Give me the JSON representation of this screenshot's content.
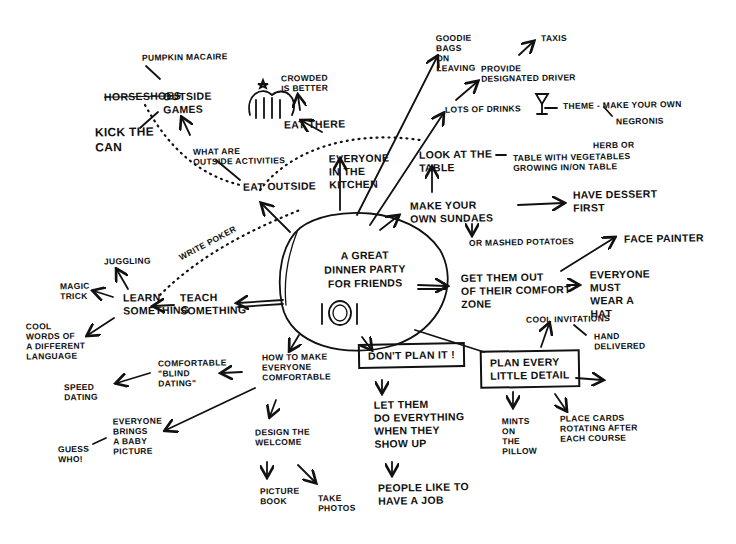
{
  "center": {
    "title": "A GREAT\nDINNER PARTY\nFOR FRIENDS",
    "icon": "plate-and-cutlery-icon"
  },
  "nodes": {
    "pumpkin": "PUMPKIN MACAIRE",
    "horseshoes": "HORSESHOES",
    "outside_games": "OUTSIDE\nGAMES",
    "kick_can": "KICK THE\nCAN",
    "outside_activities": "WHAT ARE\nOUTSIDE ACTIVITIES",
    "eat_outside": "EAT OUTSIDE",
    "crowded": "CROWDED\nIS BETTER",
    "eat_there": "EAT THERE",
    "kitchen": "EVERYONE\nIN THE\nKITCHEN",
    "goodie": "GOODIE\nBAGS\nON\nLEAVING",
    "taxis": "TAXIS",
    "driver": "PROVIDE\nDESIGNATED DRIVER",
    "drinks": "LOTS OF DRINKS",
    "theme": "THEME - MAKE YOUR OWN",
    "negronis": "NEGRONIS",
    "look_table": "LOOK AT THE\nTABLE",
    "herb": "HERB OR",
    "table_veg": "TABLE WITH VEGETABLES\nGROWING IN/ON TABLE",
    "sundaes": "MAKE YOUR\nOWN SUNDAES",
    "dessert": "HAVE DESSERT\nFIRST",
    "potatoes": "OR MASHED POTATOES",
    "face_painter": "FACE PAINTER",
    "comfort_zone": "GET THEM OUT\nOF THEIR COMFORT\nZONE",
    "hat": "EVERYONE\nMUST\nWEAR A\nHAT",
    "invitations": "COOL INVITATIONS",
    "hand_delivered": "HAND\nDELIVERED",
    "plan_every": "PLAN EVERY\nLITTLE DETAIL",
    "dont_plan": "DON'T PLAN IT !",
    "mints": "MINTS\nON\nTHE\nPILLOW",
    "place_cards": "PLACE CARDS\nROTATING AFTER\nEACH COURSE",
    "let_them": "LET THEM\nDO EVERYTHING\nWHEN THEY\nSHOW UP",
    "job": "PEOPLE LIKE TO\nHAVE A JOB",
    "comfortable": "HOW TO MAKE\nEVERYONE\nCOMFORTABLE",
    "welcome": "DESIGN THE\nWELCOME",
    "picture_book": "PICTURE\nBOOK",
    "photos": "TAKE\nPHOTOS",
    "blind": "COMFORTABLE\n\"BLIND\nDATING\"",
    "speed": "SPEED\nDATING",
    "baby": "EVERYONE\nBRINGS\nA BABY\nPICTURE",
    "guess": "GUESS\nWHO!",
    "teach": "TEACH\nSOMETHING",
    "learn": "LEARN\nSOMETHING",
    "juggling": "JUGGLING",
    "magic": "MAGIC\nTRICK",
    "language": "COOL\nWORDS OF\nA DIFFERENT\nLANGUAGE",
    "poker": "WRITE POKER"
  },
  "decorations": {
    "crowd_sketch": "crowd-sketch-icon",
    "cocktail": "cocktail-glass-icon"
  }
}
